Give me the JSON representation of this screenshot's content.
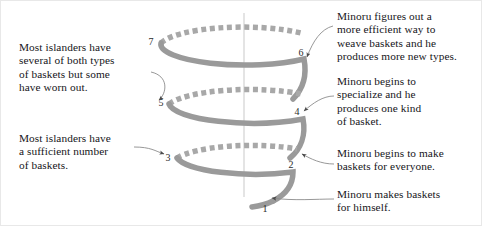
{
  "diagram": {
    "type": "spiral-process-diagram",
    "colors": {
      "coil_solid": "#9a9a9a",
      "coil_dashed": "#a8a8a8",
      "axis_line": "#c9c9c9",
      "leader_line": "#8c8c8c",
      "text": "#16161a",
      "background": "#ffffff",
      "border": "#e8e8e8"
    },
    "axis": {
      "label": "vertical-center-axis",
      "x": 243,
      "y_top": 12,
      "y_bottom": 196
    },
    "turns": 3,
    "steps": [
      {
        "number": "1",
        "side": "right",
        "label_x": 264,
        "label_y": 208,
        "note": "himself"
      },
      {
        "number": "2",
        "side": "right",
        "label_x": 288,
        "label_y": 163,
        "note": "everyone"
      },
      {
        "number": "3",
        "side": "left",
        "label_x": 169,
        "label_y": 156,
        "note": "islanders_sufficient"
      },
      {
        "number": "4",
        "side": "right",
        "label_x": 292,
        "label_y": 110,
        "note": "specialize"
      },
      {
        "number": "5",
        "side": "left",
        "label_x": 162,
        "label_y": 101,
        "note": "islanders_worn"
      },
      {
        "number": "6",
        "side": "right",
        "label_x": 298,
        "label_y": 51,
        "note": "efficient"
      },
      {
        "number": "7",
        "side": "left",
        "label_x": 154,
        "label_y": 40,
        "note": null
      }
    ],
    "notes": {
      "islanders_worn": "Most islanders have\nseveral of both types\nof baskets but some\nhave worn out.",
      "islanders_sufficient": "Most islanders have\na sufficient number\nof baskets.",
      "efficient": "Minoru figures out a\nmore efficient way to\nweave baskets and he\nproduces more new types.",
      "specialize": "Minoru begins to\nspecialize and he\nproduces one kind\nof basket.",
      "everyone": "Minoru begins to make\nbaskets for everyone.",
      "himself": "Minoru makes baskets\nfor himself."
    }
  }
}
